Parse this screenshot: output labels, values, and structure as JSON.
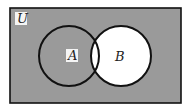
{
  "diagram": {
    "type": "venn",
    "universe_label": "U",
    "sets": [
      {
        "label": "A",
        "shaded": true
      },
      {
        "label": "B",
        "shaded": false
      }
    ],
    "shaded_region": "complement of B",
    "colors": {
      "shade": "#9a9a9a",
      "unshaded": "#ffffff",
      "stroke": "#111111"
    }
  }
}
